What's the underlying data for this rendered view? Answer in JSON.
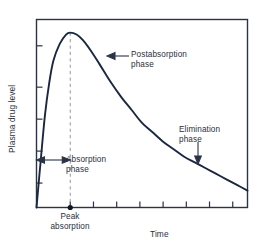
{
  "figure": {
    "title": "",
    "background_color": "#ffffff",
    "frame_color": "#2b3348",
    "curve_color": "#1b2740",
    "dash_color": "#9aa0ab",
    "text_color": "#2b2f3a"
  },
  "axes": {
    "y": {
      "label": "Plasma drug level",
      "tick_count": 5,
      "tick_positions": [
        0.13,
        0.3,
        0.47,
        0.64,
        0.86
      ]
    },
    "x": {
      "label": "Time",
      "tick_count": 8,
      "tick_positions": [
        0.16,
        0.27,
        0.38,
        0.49,
        0.6,
        0.71,
        0.82,
        0.93
      ]
    }
  },
  "annotations": {
    "postabsorption": {
      "line1": "Postabsorption",
      "line2": "phase"
    },
    "absorption": {
      "line1": "Absorption",
      "line2": "phase"
    },
    "elimination": {
      "line1": "Elimination",
      "line2": "phase"
    },
    "peak_absorption": {
      "line1": "Peak",
      "line2": "absorption"
    }
  },
  "markers": {
    "peak_marker_label": "peak-absorption-dot",
    "peak_dashed_line_label": "peak-time-dashed-line"
  },
  "chart_data": {
    "type": "line",
    "title": "",
    "xlabel": "Time",
    "ylabel": "Plasma drug level",
    "xlim": [
      0,
      1
    ],
    "ylim": [
      0,
      1
    ],
    "grid": false,
    "legend": null,
    "axis_tick_labels": {
      "x": [],
      "y": []
    },
    "series": [
      {
        "name": "Plasma drug concentration",
        "x": [
          0.0,
          0.02,
          0.04,
          0.06,
          0.08,
          0.11,
          0.14,
          0.16,
          0.19,
          0.22,
          0.26,
          0.3,
          0.35,
          0.4,
          0.45,
          0.5,
          0.55,
          0.6,
          0.65,
          0.7,
          0.75,
          0.8,
          0.85,
          0.9,
          0.95,
          1.0
        ],
        "y": [
          0.0,
          0.25,
          0.49,
          0.66,
          0.78,
          0.87,
          0.92,
          0.93,
          0.92,
          0.89,
          0.83,
          0.76,
          0.67,
          0.59,
          0.52,
          0.45,
          0.4,
          0.35,
          0.31,
          0.27,
          0.24,
          0.21,
          0.18,
          0.15,
          0.12,
          0.09
        ]
      }
    ],
    "peak": {
      "x": 0.16,
      "y": 0.93,
      "label": "Peak absorption"
    },
    "phases": [
      {
        "name": "Absorption phase",
        "x_start": 0.0,
        "x_end": 0.16
      },
      {
        "name": "Postabsorption phase",
        "x_start": 0.16,
        "x_end": 0.7
      },
      {
        "name": "Elimination phase",
        "x_start": 0.7,
        "x_end": 1.0
      }
    ]
  }
}
